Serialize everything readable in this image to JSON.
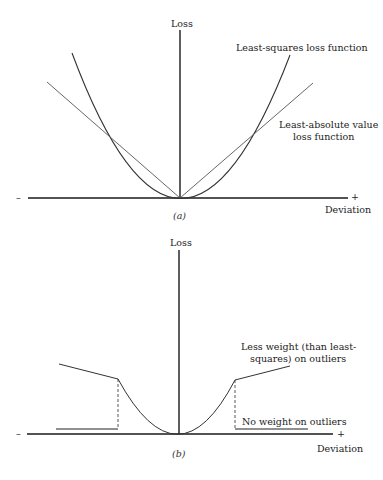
{
  "panel_a": {
    "y_axis_label": "Loss",
    "x_axis_label": "Deviation",
    "x_minus": "–",
    "x_plus": "+",
    "caption": "(a)",
    "curve_labels": {
      "least_squares": "Least-squares loss function",
      "least_absolute_line1": "Least-absolute value",
      "least_absolute_line2": "loss function"
    }
  },
  "panel_b": {
    "y_axis_label": "Loss",
    "x_axis_label": "Deviation",
    "x_minus": "–",
    "x_plus": "+",
    "caption": "(b)",
    "annotations": {
      "less_weight_line1": "Less weight (than least-",
      "less_weight_line2": "squares) on outliers",
      "no_weight": "No weight on outliers"
    }
  },
  "colors": {
    "axis": "#1a1a1a",
    "curve": "#333333",
    "line": "#555555"
  }
}
